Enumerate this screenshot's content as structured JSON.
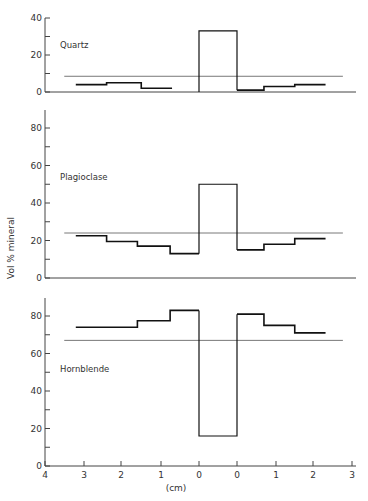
{
  "chart_data": {
    "type": "line",
    "title": "",
    "xlabel": "(cm)",
    "ylabel": "Vol % mineral",
    "x_tick_labels": [
      "4",
      "3",
      "2",
      "1",
      "0",
      "0",
      "1",
      "2",
      "3"
    ],
    "x_description": "Distance from vein/contact in cm; left side 4→0, central zone, right side 0→3",
    "panels": [
      {
        "name": "Quartz",
        "ylim": [
          0,
          40
        ],
        "y_ticks": [
          0,
          10,
          20,
          30,
          40
        ],
        "y_tick_labels": [
          "0",
          "",
          "20",
          "",
          "40"
        ],
        "mean_line": 8.5,
        "steps_left": [
          {
            "from_cm": 3.2,
            "to_cm": 2.4,
            "value": 4
          },
          {
            "from_cm": 2.4,
            "to_cm": 1.5,
            "value": 5
          },
          {
            "from_cm": 1.5,
            "to_cm": 0.7,
            "value": 2
          }
        ],
        "center_value": 33,
        "steps_right": [
          {
            "from_cm": 0,
            "to_cm": 0.7,
            "value": 1
          },
          {
            "from_cm": 0.7,
            "to_cm": 1.5,
            "value": 3
          },
          {
            "from_cm": 1.5,
            "to_cm": 2.3,
            "value": 4
          }
        ]
      },
      {
        "name": "Plagioclase",
        "ylim": [
          0,
          90
        ],
        "y_ticks": [
          0,
          10,
          20,
          30,
          40,
          50,
          60,
          70,
          80
        ],
        "y_tick_labels": [
          "0",
          "",
          "20",
          "",
          "40",
          "",
          "60",
          "",
          "80"
        ],
        "mean_line": 24,
        "steps_left": [
          {
            "from_cm": 3.2,
            "to_cm": 2.4,
            "value": 22.5
          },
          {
            "from_cm": 2.4,
            "to_cm": 1.6,
            "value": 19.5
          },
          {
            "from_cm": 1.6,
            "to_cm": 0.75,
            "value": 17
          },
          {
            "from_cm": 0.75,
            "to_cm": 0,
            "value": 13
          }
        ],
        "center_value": 50,
        "steps_right": [
          {
            "from_cm": 0,
            "to_cm": 0.7,
            "value": 15
          },
          {
            "from_cm": 0.7,
            "to_cm": 1.5,
            "value": 18
          },
          {
            "from_cm": 1.5,
            "to_cm": 2.3,
            "value": 21
          }
        ]
      },
      {
        "name": "Hornblende",
        "ylim": [
          0,
          90
        ],
        "y_ticks": [
          0,
          10,
          20,
          30,
          40,
          50,
          60,
          70,
          80
        ],
        "y_tick_labels": [
          "0",
          "",
          "20",
          "",
          "40",
          "",
          "60",
          "",
          "80"
        ],
        "mean_line": 67,
        "steps_left": [
          {
            "from_cm": 3.2,
            "to_cm": 1.6,
            "value": 74
          },
          {
            "from_cm": 1.6,
            "to_cm": 0.75,
            "value": 77.5
          },
          {
            "from_cm": 0.75,
            "to_cm": 0,
            "value": 83
          }
        ],
        "center_value": 16,
        "steps_right": [
          {
            "from_cm": 0,
            "to_cm": 0.7,
            "value": 81
          },
          {
            "from_cm": 0.7,
            "to_cm": 1.5,
            "value": 75
          },
          {
            "from_cm": 1.5,
            "to_cm": 2.3,
            "value": 71
          }
        ]
      }
    ]
  }
}
